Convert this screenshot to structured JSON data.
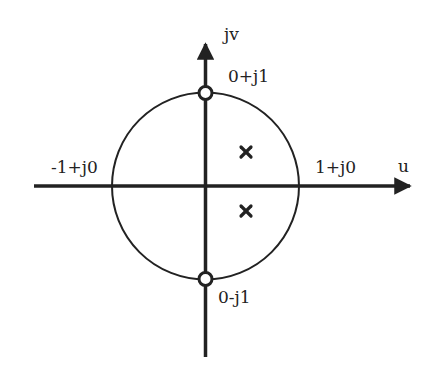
{
  "diagram": {
    "type": "complex-plane pole-zero plot",
    "colors": {
      "stroke": "#222222",
      "background": "#ffffff"
    },
    "axes": {
      "horizontal_label": "u",
      "vertical_label": "jv"
    },
    "unit_circle": {
      "labels": {
        "top": "0+j1",
        "bottom": "0-j1",
        "left": "-1+j0",
        "right": "1+j0"
      }
    },
    "zeros": [
      {
        "position": "0+j1",
        "symbol": "circle"
      },
      {
        "position": "0-j1",
        "symbol": "circle"
      }
    ],
    "poles": [
      {
        "position": "upper-right interior",
        "symbol": "x"
      },
      {
        "position": "lower-right interior",
        "symbol": "x"
      }
    ]
  }
}
